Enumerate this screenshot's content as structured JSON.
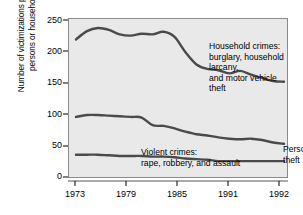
{
  "axes": {
    "ylabel": "Number of victimizations per 1,000\npersons or households",
    "yticks": [
      "0",
      "50",
      "100",
      "150",
      "200",
      "250"
    ],
    "xticks": [
      "1973",
      "1979",
      "1985",
      "1991",
      "1992"
    ]
  },
  "annotations": {
    "household": "Household crimes:\nburglary, household larcany,\nand motor vehicle theft",
    "violent": "Violent crimes:\nrape, robbery, and assault",
    "personal": "Personal theft"
  },
  "colors": {
    "panel_background": "#e9e9e9",
    "panel_border": "#8a8a8a",
    "line": "#4a4a4a",
    "text": "#000000"
  },
  "chart_data": {
    "type": "line",
    "title": "",
    "xlabel": "",
    "ylabel": "Number of victimizations per 1,000 persons or households",
    "xlim": [
      1973,
      1992
    ],
    "ylim": [
      0,
      250
    ],
    "yticks": [
      0,
      50,
      100,
      150,
      200,
      250
    ],
    "xticks": [
      1973,
      1979,
      1985,
      1991,
      1992
    ],
    "grid": false,
    "legend": "inline-annotations",
    "x": [
      1973,
      1974,
      1975,
      1976,
      1977,
      1978,
      1979,
      1980,
      1981,
      1982,
      1983,
      1984,
      1985,
      1986,
      1987,
      1988,
      1989,
      1990,
      1991,
      1992
    ],
    "series": [
      {
        "name": "Household crimes: burglary, household larcany, and motor vehicle theft",
        "values": [
          218,
          231,
          236,
          233,
          226,
          224,
          227,
          226,
          230,
          222,
          198,
          179,
          172,
          170,
          165,
          169,
          163,
          158,
          153,
          152
        ]
      },
      {
        "name": "Personal theft",
        "values": [
          97,
          100,
          100,
          99,
          98,
          97,
          96,
          84,
          83,
          79,
          74,
          70,
          68,
          65,
          63,
          62,
          63,
          61,
          57,
          55
        ]
      },
      {
        "name": "Violent crimes: rape, robbery, and assault",
        "values": [
          38,
          38,
          38,
          37,
          36,
          36,
          36,
          35,
          35,
          34,
          32,
          31,
          30,
          28,
          28,
          28,
          28,
          28,
          28,
          28
        ]
      }
    ]
  }
}
